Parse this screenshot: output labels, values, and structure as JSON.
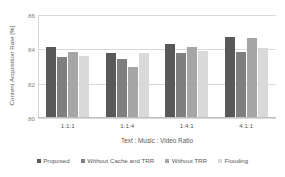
{
  "chart_data": {
    "type": "bar",
    "title": "",
    "xlabel": "Text : Music : Video Ratio",
    "ylabel": "Content Acquisition Rate [%]",
    "categories": [
      "1:1:1",
      "1:1:4",
      "1:4:1",
      "4:1:1"
    ],
    "ylim": [
      80,
      86
    ],
    "yticks": [
      86,
      84,
      82,
      80
    ],
    "ytick_labels": [
      "86",
      "84",
      "82",
      "80"
    ],
    "grid": true,
    "legend_position": "bottom",
    "series": [
      {
        "name": "Proposed",
        "color": "#595959",
        "values": [
          84.05,
          83.7,
          84.25,
          84.65
        ]
      },
      {
        "name": "Without Cache and TRR",
        "color": "#7f7f7f",
        "values": [
          83.5,
          83.4,
          83.75,
          83.8
        ]
      },
      {
        "name": "Without TRR",
        "color": "#a6a6a6",
        "values": [
          83.8,
          82.9,
          84.05,
          84.6
        ]
      },
      {
        "name": "Flooding",
        "color": "#d9d9d9",
        "values": [
          83.55,
          83.7,
          83.85,
          84.0
        ]
      }
    ]
  }
}
